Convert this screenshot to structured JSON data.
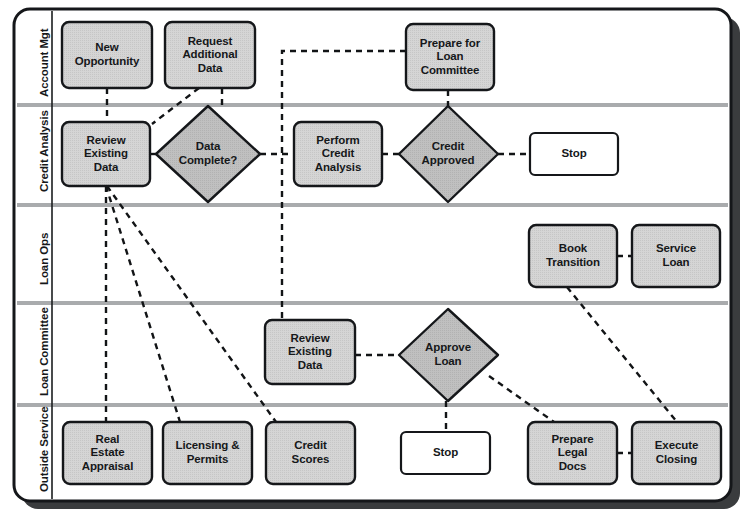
{
  "diagram": {
    "type": "swimlane-flowchart",
    "style": {
      "frame_border_color": "#1b1d1f",
      "frame_fill": "#ffffff",
      "shadow_color": "#2a2c2e",
      "lane_divider_color": "#a9abad",
      "process_fill": "#d4d4d4",
      "process_border": "#1b1d1f",
      "decision_fill": "#bfbfbf",
      "terminator_fill": "#ffffff",
      "connector_color": "#121416"
    },
    "lanes": [
      {
        "id": "account-mgt",
        "label": "Account Mgt",
        "top": 14,
        "bottom": 105
      },
      {
        "id": "credit-analysis",
        "label": "Credit Analysis",
        "top": 105,
        "bottom": 205
      },
      {
        "id": "loan-ops",
        "label": "Loan Ops",
        "top": 205,
        "bottom": 303
      },
      {
        "id": "loan-committee",
        "label": "Loan Committee",
        "top": 303,
        "bottom": 405
      },
      {
        "id": "outside-service",
        "label": "Outside Service",
        "top": 405,
        "bottom": 499
      }
    ],
    "nodes": [
      {
        "id": "new-opportunity",
        "label": "New\nOpportunity",
        "shape": "process",
        "lane": "account-mgt",
        "x": 62,
        "y": 22,
        "w": 90,
        "h": 66
      },
      {
        "id": "request-additional-data",
        "label": "Request\nAdditional\nData",
        "shape": "process",
        "lane": "account-mgt",
        "x": 165,
        "y": 22,
        "w": 90,
        "h": 66
      },
      {
        "id": "prepare-for-loan-committee",
        "label": "Prepare for\nLoan\nCommittee",
        "shape": "process",
        "lane": "account-mgt",
        "x": 406,
        "y": 24,
        "w": 88,
        "h": 66
      },
      {
        "id": "review-existing-data-credit",
        "label": "Review\nExisting\nData",
        "shape": "process",
        "lane": "credit-analysis",
        "x": 62,
        "y": 122,
        "w": 88,
        "h": 64
      },
      {
        "id": "data-complete",
        "label": "Data\nComplete?",
        "shape": "decision",
        "lane": "credit-analysis",
        "cx": 208,
        "cy": 154,
        "rx": 52,
        "ry": 48
      },
      {
        "id": "perform-credit-analysis",
        "label": "Perform\nCredit\nAnalysis",
        "shape": "process",
        "lane": "credit-analysis",
        "x": 294,
        "y": 122,
        "w": 88,
        "h": 64
      },
      {
        "id": "credit-approved",
        "label": "Credit\nApproved",
        "shape": "decision",
        "lane": "credit-analysis",
        "cx": 448,
        "cy": 154,
        "rx": 50,
        "ry": 48
      },
      {
        "id": "stop-credit",
        "label": "Stop",
        "shape": "terminator",
        "lane": "credit-analysis",
        "x": 530,
        "y": 133,
        "w": 88,
        "h": 42
      },
      {
        "id": "book-transition",
        "label": "Book\nTransition",
        "shape": "process",
        "lane": "loan-ops",
        "x": 529,
        "y": 225,
        "w": 88,
        "h": 62
      },
      {
        "id": "service-loan",
        "label": "Service\nLoan",
        "shape": "process",
        "lane": "loan-ops",
        "x": 632,
        "y": 225,
        "w": 88,
        "h": 62
      },
      {
        "id": "review-existing-data-committee",
        "label": "Review\nExisting\nData",
        "shape": "process",
        "lane": "loan-committee",
        "x": 265,
        "y": 320,
        "w": 90,
        "h": 64
      },
      {
        "id": "approve-loan",
        "label": "Approve\nLoan",
        "shape": "decision",
        "lane": "loan-committee",
        "cx": 448,
        "cy": 355,
        "rx": 50,
        "ry": 46
      },
      {
        "id": "real-estate-appraisal",
        "label": "Real\nEstate\nAppraisal",
        "shape": "process",
        "lane": "outside-service",
        "x": 63,
        "y": 422,
        "w": 89,
        "h": 62
      },
      {
        "id": "licensing-and-permits",
        "label": "Licensing &\nPermits",
        "shape": "process",
        "lane": "outside-service",
        "x": 163,
        "y": 422,
        "w": 89,
        "h": 62
      },
      {
        "id": "credit-scores",
        "label": "Credit\nScores",
        "shape": "process",
        "lane": "outside-service",
        "x": 266,
        "y": 422,
        "w": 89,
        "h": 62
      },
      {
        "id": "stop-approve",
        "label": "Stop",
        "shape": "terminator",
        "lane": "outside-service",
        "x": 401,
        "y": 432,
        "w": 89,
        "h": 42
      },
      {
        "id": "prepare-legal-docs",
        "label": "Prepare\nLegal\nDocs",
        "shape": "process",
        "lane": "outside-service",
        "x": 528,
        "y": 422,
        "w": 89,
        "h": 62
      },
      {
        "id": "execute-closing",
        "label": "Execute\nClosing",
        "shape": "process",
        "lane": "outside-service",
        "x": 632,
        "y": 422,
        "w": 89,
        "h": 62
      }
    ],
    "connectors": [
      {
        "id": "new-opportunity-to-review",
        "from": "new-opportunity",
        "to": "review-existing-data-credit",
        "path": "M107,88 L107,122"
      },
      {
        "id": "request-data-to-review",
        "from": "request-additional-data",
        "to": "review-existing-data-credit",
        "path": "M198,88 L150,124"
      },
      {
        "id": "request-data-to-data-complete",
        "from": "request-additional-data",
        "to": "data-complete",
        "path": "M222,88 L222,108"
      },
      {
        "id": "review-to-data-complete",
        "from": "review-existing-data-credit",
        "to": "data-complete",
        "path": "M150,154 L156,154"
      },
      {
        "id": "data-complete-to-perform",
        "from": "data-complete",
        "to": "perform-credit-analysis",
        "path": "M260,154 L294,154"
      },
      {
        "id": "perform-to-credit-approved",
        "from": "perform-credit-analysis",
        "to": "credit-approved",
        "path": "M382,154 L398,154"
      },
      {
        "id": "credit-approved-to-stop",
        "from": "credit-approved",
        "to": "stop-credit",
        "path": "M498,154 L530,154"
      },
      {
        "id": "prepare-committee-to-branch",
        "from": "prepare-for-loan-committee",
        "to": "review-existing-data-committee",
        "path": "M406,51 L282,51 L282,320"
      },
      {
        "id": "prepare-committee-to-credit-approved",
        "from": "prepare-for-loan-committee",
        "to": "credit-approved",
        "path": "M448,90 L448,106"
      },
      {
        "id": "review-to-real-estate",
        "from": "review-existing-data-credit",
        "to": "real-estate-appraisal",
        "path": "M106,186 L106,422"
      },
      {
        "id": "review-to-licensing",
        "from": "review-existing-data-credit",
        "to": "licensing-and-permits",
        "path": "M106,186 L179,422"
      },
      {
        "id": "review-to-credit-scores",
        "from": "review-existing-data-credit",
        "to": "credit-scores",
        "path": "M106,186 L275,422"
      },
      {
        "id": "committee-review-to-approve",
        "from": "review-existing-data-committee",
        "to": "approve-loan",
        "path": "M355,355 L398,355"
      },
      {
        "id": "approve-to-stop",
        "from": "approve-loan",
        "to": "stop-approve",
        "path": "M446,401 L446,432"
      },
      {
        "id": "approve-to-prepare-legal",
        "from": "approve-loan",
        "to": "prepare-legal-docs",
        "path": "M488,375 L553,422"
      },
      {
        "id": "prepare-legal-to-execute",
        "from": "prepare-legal-docs",
        "to": "execute-closing",
        "path": "M617,453 L632,453"
      },
      {
        "id": "book-transition-to-execute",
        "from": "book-transition",
        "to": "execute-closing",
        "path": "M566,287 L676,422"
      }
    ]
  }
}
